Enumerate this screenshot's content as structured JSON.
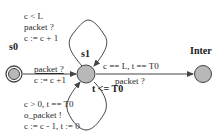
{
  "diagram": {
    "type": "timed-automaton",
    "colors": {
      "state_fill": "#b8b8b8",
      "edge": "#444444",
      "text": "#2a2a2a"
    },
    "states": [
      {
        "id": "s0",
        "label": "s0",
        "initial": true
      },
      {
        "id": "s1",
        "label": "s1",
        "invariant": "t <= T0"
      },
      {
        "id": "Inter",
        "label": "Inter"
      }
    ],
    "edges": {
      "s1_loop_top": {
        "from": "s1",
        "to": "s1",
        "guard": "c < L",
        "sync": "packet ?",
        "update": "c := c + 1"
      },
      "s0_to_s1": {
        "from": "s0",
        "to": "s1",
        "sync": "packet ?",
        "update": "c := c +1"
      },
      "s1_loop_bottom": {
        "from": "s1",
        "to": "s1",
        "guard": "c > 0, t == T0",
        "sync": "o_packet !",
        "update": "c := c - 1, t := 0"
      },
      "s1_to_inter": {
        "from": "s1",
        "to": "Inter",
        "guard": "c == L, t == T0",
        "sync": "packet ?"
      }
    }
  }
}
